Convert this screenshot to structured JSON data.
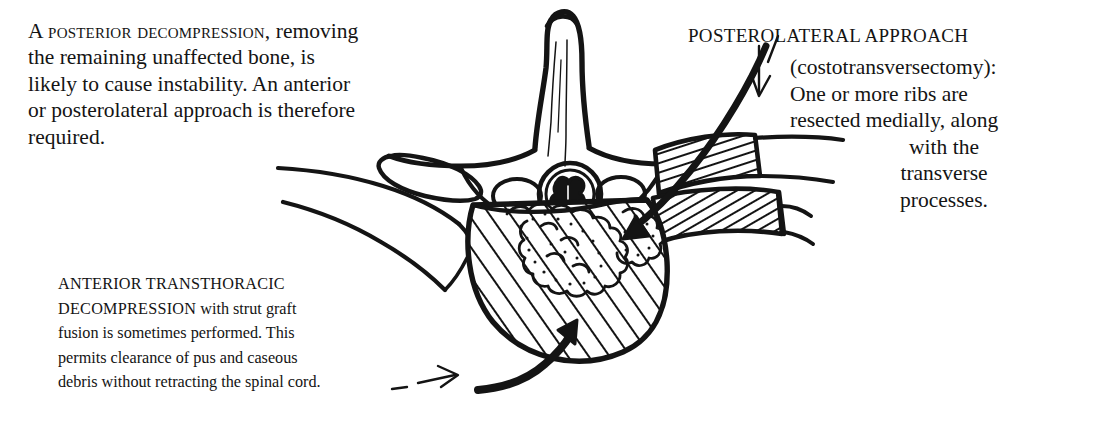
{
  "page": {
    "background_color": "#ffffff",
    "ink_color": "#141414",
    "width": 1117,
    "height": 426
  },
  "annotations": {
    "posterior_decompression": {
      "lead": "A posterior decompression,",
      "lines": [
        "removing the remaining unaffected",
        "bone, is likely to cause instability.",
        "An anterior or posterolateral",
        "approach is therefore",
        "required."
      ],
      "full_text": "A POSTERIOR DECOMPRESSION, removing the remaining unaffected bone, is likely to cause instability. An anterior or posterolateral approach is therefore required."
    },
    "posterolateral_approach": {
      "title": "POSTEROLATERAL APPROACH",
      "lines": [
        "(costotransversectomy):",
        "One or more ribs are",
        "resected medially, along",
        "with the",
        "transverse",
        "processes."
      ],
      "full_text": "POSTEROLATERAL APPROACH (costotransversectomy): One or more ribs are resected medially, along with the transverse processes."
    },
    "anterior_transthoracic": {
      "lead_line_1": "ANTERIOR TRANSTHORACIC",
      "lead_line_2_caps": "DECOMPRESSION",
      "lead_line_2_rest": " with strut graft",
      "lines": [
        "fusion is sometimes performed. This",
        "permits clearance of pus and caseous",
        "debris without retracting the spinal cord."
      ],
      "full_text": "ANTERIOR TRANSTHORACIC DECOMPRESSION with strut graft fusion is sometimes performed. This permits clearance of pus and caseous debris without retracting the spinal cord."
    }
  },
  "figure": {
    "caption": "Axial cross-section of a thoracic vertebra showing tuberculous destruction of the vertebral body, with surgical approach arrows",
    "parts": [
      {
        "name": "spinous-process",
        "label": "spinous process"
      },
      {
        "name": "lamina",
        "label": "lamina"
      },
      {
        "name": "transverse-process-left",
        "label": "left transverse process"
      },
      {
        "name": "transverse-process-right-hatched",
        "label": "right transverse process (resected, hatched)"
      },
      {
        "name": "rib-left",
        "label": "left rib"
      },
      {
        "name": "rib-right-hatched",
        "label": "right rib (resected, hatched)"
      },
      {
        "name": "spinal-cord",
        "label": "spinal cord"
      },
      {
        "name": "vertebral-body-hatched",
        "label": "vertebral body with caseous debris"
      },
      {
        "name": "caseous-debris",
        "label": "caseous debris / pus"
      },
      {
        "name": "pedicle-foramen-left",
        "label": "left foramen"
      },
      {
        "name": "pedicle-foramen-right",
        "label": "right foramen"
      }
    ],
    "arrows": [
      {
        "name": "arrow-anterior-approach",
        "style": "thick-curved",
        "points_to": "vertebral body from antero-inferior"
      },
      {
        "name": "arrow-anterior-pointer",
        "style": "thin-dashed",
        "points_to": "anterior approach arrow"
      },
      {
        "name": "arrow-posterolateral-approach",
        "style": "thick-curved",
        "points_to": "right rib bed, directed infero-medially"
      },
      {
        "name": "arrow-posterolateral-pointer",
        "style": "thin",
        "points_to": "posterolateral approach arrow"
      }
    ]
  }
}
